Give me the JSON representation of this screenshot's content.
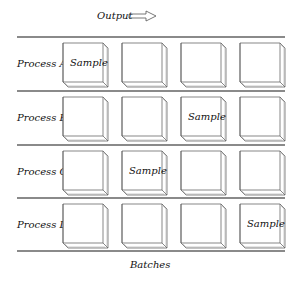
{
  "header": {
    "title": "Output",
    "arrow_icon": "arrow-right-outline"
  },
  "rows": [
    {
      "label": "Process A",
      "sample_col": 0
    },
    {
      "label": "Process B",
      "sample_col": 2
    },
    {
      "label": "Process C",
      "sample_col": 1
    },
    {
      "label": "Process D",
      "sample_col": 3
    }
  ],
  "columns": 4,
  "sample_label": "Sample",
  "footer": {
    "label": "Batches"
  },
  "colors": {
    "rule": "#8a8a8a",
    "box_stroke": "#555555"
  }
}
